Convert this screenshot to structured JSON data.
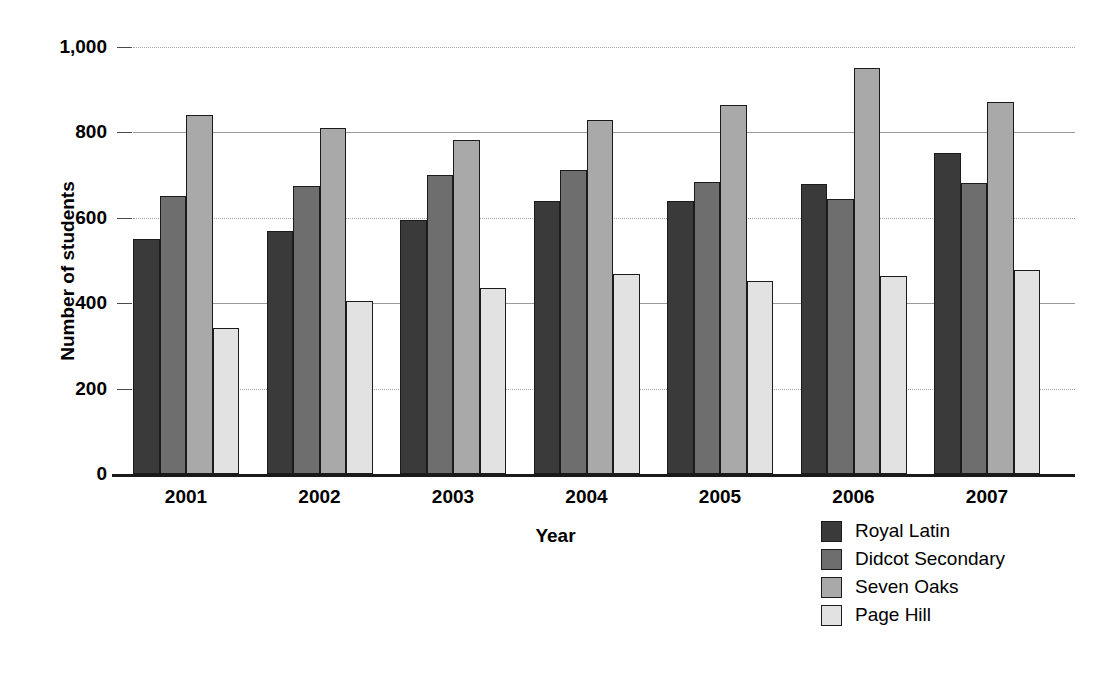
{
  "chart_data": {
    "type": "bar",
    "title": "",
    "subtitle": "",
    "xlabel": "Year",
    "ylabel": "Number of students",
    "categories": [
      "2001",
      "2002",
      "2003",
      "2004",
      "2005",
      "2006",
      "2007"
    ],
    "series": [
      {
        "name": "Royal Latin",
        "color": "#3a3a3a",
        "values": [
          550,
          570,
          595,
          640,
          640,
          680,
          752
        ]
      },
      {
        "name": "Didcot Secondary",
        "color": "#6e6e6e",
        "values": [
          650,
          675,
          700,
          712,
          685,
          645,
          682
        ]
      },
      {
        "name": "Seven Oaks",
        "color": "#a9a9a9",
        "values": [
          840,
          810,
          782,
          830,
          865,
          952,
          872
        ]
      },
      {
        "name": "Page Hill",
        "color": "#e2e2e2",
        "values": [
          342,
          405,
          435,
          468,
          453,
          463,
          478
        ]
      }
    ],
    "ylim": [
      0,
      1000
    ],
    "yticks": [
      0,
      200,
      400,
      600,
      800,
      1000
    ],
    "ytick_labels": [
      "0",
      "200",
      "400",
      "600",
      "800",
      "1,000"
    ],
    "grid": true,
    "grid_axis": "y",
    "legend_position": "bottom-right",
    "bar_border_color": "#1b1b1b",
    "background_color": "#ffffff"
  }
}
